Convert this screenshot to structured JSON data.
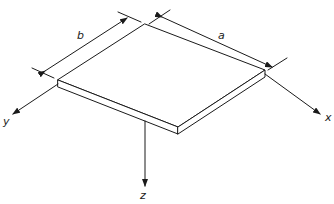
{
  "diagram": {
    "type": "isometric-plate",
    "dimensions": {
      "a": {
        "label": "a"
      },
      "b": {
        "label": "b"
      }
    },
    "axes": {
      "x": {
        "label": "x"
      },
      "y": {
        "label": "y"
      },
      "z": {
        "label": "z"
      }
    },
    "colors": {
      "stroke": "#1a1a1a",
      "background": "#ffffff"
    }
  }
}
